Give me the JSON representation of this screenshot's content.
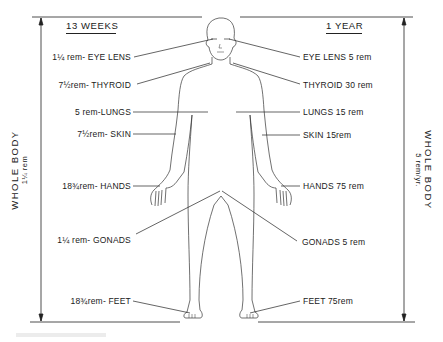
{
  "figure": {
    "left_column": {
      "header": "13 WEEKS",
      "whole_body": {
        "label": "WHOLE BODY",
        "value": "1¼ rem"
      },
      "items": [
        {
          "organ": "EYE LENS",
          "dose": "1¼ rem",
          "text": "1¼ rem- EYE LENS"
        },
        {
          "organ": "THYROID",
          "dose": "7½ rem",
          "text": "7½rem- THYROID"
        },
        {
          "organ": "LUNGS",
          "dose": "5 rem",
          "text": "5 rem-LUNGS"
        },
        {
          "organ": "SKIN",
          "dose": "7½ rem",
          "text": "7½rem- SKIN"
        },
        {
          "organ": "HANDS",
          "dose": "18¾ rem",
          "text": "18¾rem- HANDS"
        },
        {
          "organ": "GONADS",
          "dose": "1¼ rem",
          "text": "1¼ rem- GONADS"
        },
        {
          "organ": "FEET",
          "dose": "18¾ rem",
          "text": "18¾rem- FEET"
        }
      ]
    },
    "right_column": {
      "header": "1 YEAR",
      "whole_body": {
        "label": "WHOLE BODY",
        "value": "5 rem/yr."
      },
      "items": [
        {
          "organ": "EYE LENS",
          "dose": "5 rem",
          "text": "EYE LENS  5 rem"
        },
        {
          "organ": "THYROID",
          "dose": "30 rem",
          "text": "THYROID  30 rem"
        },
        {
          "organ": "LUNGS",
          "dose": "15 rem",
          "text": "LUNGS  15 rem"
        },
        {
          "organ": "SKIN",
          "dose": "15 rem",
          "text": "SKIN  15rem"
        },
        {
          "organ": "HANDS",
          "dose": "75 rem",
          "text": "HANDS  75 rem"
        },
        {
          "organ": "GONADS",
          "dose": "5 rem",
          "text": "GONADS  5 rem"
        },
        {
          "organ": "FEET",
          "dose": "75 rem",
          "text": "FEET  75rem"
        }
      ]
    },
    "colors": {
      "ink": "#1a1a1a",
      "background": "#ffffff"
    }
  }
}
